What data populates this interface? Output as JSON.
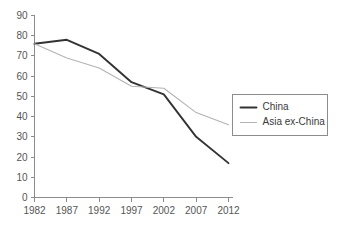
{
  "chart_data": {
    "type": "line",
    "title": "",
    "subtitle": "",
    "xlabel": "",
    "ylabel": "",
    "x": [
      1982,
      1987,
      1992,
      1997,
      2002,
      2007,
      2012
    ],
    "xticklabels": [
      "1982",
      "1987",
      "1992",
      "1997",
      "2002",
      "2007",
      "2012"
    ],
    "yticks": [
      0,
      10,
      20,
      30,
      40,
      50,
      60,
      70,
      80,
      90
    ],
    "yticklabels": [
      "0",
      "10",
      "20",
      "30",
      "40",
      "50",
      "60",
      "70",
      "80",
      "90"
    ],
    "xlim": [
      1982,
      2012
    ],
    "ylim": [
      0,
      90
    ],
    "grid": false,
    "legend_position": "right-outside",
    "series": [
      {
        "name": "China",
        "color": "#333333",
        "width": 1.9,
        "values": [
          76,
          78,
          71,
          57,
          51,
          30,
          17
        ]
      },
      {
        "name": "Asia ex-China",
        "color": "#b3b3b3",
        "width": 1.1,
        "values": [
          76,
          69,
          64,
          55,
          54,
          42,
          36
        ]
      }
    ]
  },
  "legend": {
    "items": [
      {
        "label": "China"
      },
      {
        "label": "Asia ex-China"
      }
    ]
  },
  "colors": {
    "axis": "#8c8c8c",
    "text": "#555555",
    "background": "#ffffff",
    "china": "#333333",
    "asia_ex_china": "#b3b3b3"
  }
}
